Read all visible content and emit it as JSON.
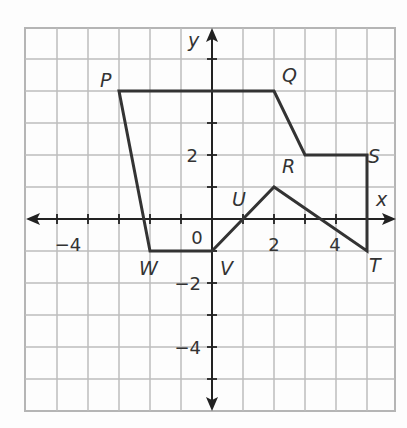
{
  "diagram": {
    "type": "coordinate-plane-figure",
    "axes": {
      "x_label": "x",
      "y_label": "y",
      "x_range": [
        -6,
        6
      ],
      "y_range": [
        -6,
        6
      ],
      "x_tick_labels": [
        "−4",
        "2",
        "4"
      ],
      "y_tick_labels": [
        "2",
        "−2",
        "−4"
      ],
      "origin_label": "0"
    },
    "vertices": [
      {
        "label": "P",
        "x": -3,
        "y": 4
      },
      {
        "label": "Q",
        "x": 2,
        "y": 4
      },
      {
        "label": "",
        "x": 3,
        "y": 2
      },
      {
        "label": "S",
        "x": 5,
        "y": 2
      },
      {
        "label": "T",
        "x": 5,
        "y": -1
      },
      {
        "label": "R",
        "x": 2,
        "y": 1
      },
      {
        "label": "U",
        "x": 1,
        "y": 0
      },
      {
        "label": "V",
        "x": 0,
        "y": -1
      },
      {
        "label": "W",
        "x": -2,
        "y": -1
      }
    ],
    "colors": {
      "grid": "#bdbdbd",
      "axis": "#222222",
      "figure": "#333333",
      "background": "#fdfdfd"
    }
  }
}
